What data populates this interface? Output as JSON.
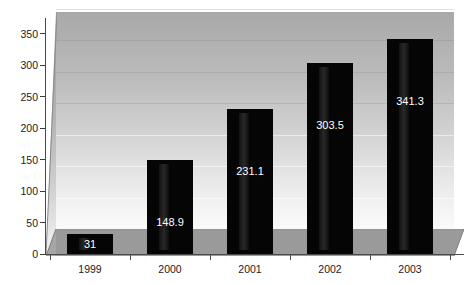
{
  "chart_data": {
    "type": "bar",
    "title": "",
    "subtitle": "",
    "xlabel": "",
    "ylabel": "",
    "categories": [
      "1999",
      "2000",
      "2001",
      "2002",
      "2003"
    ],
    "values": [
      31,
      148.9,
      231.1,
      303.5,
      341.3
    ],
    "data_labels": [
      "31",
      "148.9",
      "231.1",
      "303.5",
      "341.3"
    ],
    "series": [
      {
        "name": "",
        "values": [
          31,
          148.9,
          231.1,
          303.5,
          341.3
        ]
      }
    ],
    "ylim": [
      0,
      375
    ],
    "yticks": [
      0,
      50,
      100,
      150,
      200,
      250,
      300,
      350
    ],
    "ytick_labels": [
      "0",
      "50",
      "100",
      "150",
      "200",
      "250",
      "300",
      "350"
    ],
    "grid": true,
    "grid_axis": "y",
    "legend": false,
    "legend_position": "none",
    "style": "3d-bar",
    "colors": {
      "bar": "#050505",
      "bar_label": "#ffffff",
      "wall_top": "#a9a9a9",
      "wall_bottom": "#fbfbfb",
      "floor": "#9a9a9a",
      "axis": "#4a4a4a",
      "tick_text": "#1b1b1b",
      "background": "#ffffff"
    },
    "annotations": []
  }
}
